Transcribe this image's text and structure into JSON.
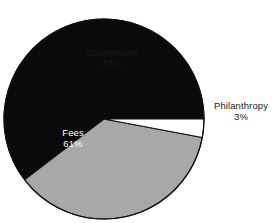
{
  "chart_data": {
    "type": "pie",
    "title": "",
    "categories": [
      "Government",
      "Fees",
      "Philanthropy"
    ],
    "values": [
      37,
      61,
      3
    ],
    "value_suffix": "%",
    "labels": [
      {
        "name": "Government",
        "value": "37%",
        "placement": "inside",
        "color": "#a8a8a8",
        "text_color": "#1a1a1a"
      },
      {
        "name": "Fees",
        "value": "61%",
        "placement": "inside",
        "color": "#0a0a0a",
        "text_color": "#ffffff"
      },
      {
        "name": "Philanthropy",
        "value": "3%",
        "placement": "outside",
        "color": "#ffffff",
        "text_color": "#1a1a1a"
      }
    ],
    "slice_colors": [
      "#a8a8a8",
      "#0a0a0a",
      "#ffffff"
    ],
    "stroke_color": "#111111",
    "background": "#ffffff",
    "legend": "none",
    "start_angle_deg": 0,
    "direction": "counterclockwise",
    "center": [
      104,
      119
    ],
    "radius": 100
  },
  "slices": {
    "government": {
      "label": "Government",
      "percent": "37%"
    },
    "fees": {
      "label": "Fees",
      "percent": "61%"
    },
    "philanthropy": {
      "label": "Philanthropy",
      "percent": "3%"
    }
  },
  "title": ""
}
